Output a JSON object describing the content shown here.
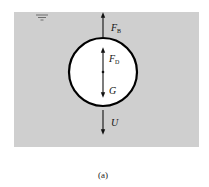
{
  "figure": {
    "caption": "(a)",
    "background_color": "#cfcfcf",
    "fluid_region": {
      "x": 14,
      "y": 12,
      "width": 185,
      "height": 135
    },
    "free_surface_symbol": {
      "x": 42,
      "y": 16
    },
    "sphere": {
      "cx": 103,
      "cy": 72,
      "r": 34,
      "fill": "#ffffff",
      "stroke": "#000000"
    }
  },
  "forces": [
    {
      "id": "buoyancy",
      "symbol": "F",
      "subscript": "B",
      "direction": "up",
      "location": "outside-top"
    },
    {
      "id": "drag",
      "symbol": "F",
      "subscript": "D",
      "direction": "up",
      "location": "inside"
    },
    {
      "id": "gravity",
      "symbol": "G",
      "subscript": "",
      "direction": "down",
      "location": "inside"
    },
    {
      "id": "velocity",
      "symbol": "U",
      "subscript": "",
      "direction": "down",
      "location": "outside-bottom"
    }
  ]
}
